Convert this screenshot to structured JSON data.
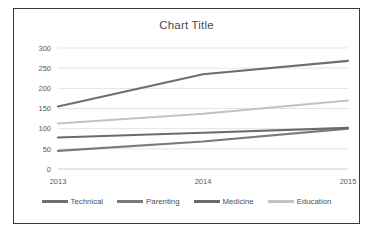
{
  "chart_data": {
    "type": "line",
    "title": "Chart Title",
    "xlabel": "",
    "ylabel": "",
    "categories": [
      "2013",
      "2014",
      "2015"
    ],
    "x": [
      2013,
      2014,
      2015
    ],
    "ylim": [
      0,
      300
    ],
    "yticks": [
      0,
      50,
      100,
      150,
      200,
      250,
      300
    ],
    "ytick_labels": [
      "0",
      "50",
      "100",
      "150",
      "200",
      "250",
      "300"
    ],
    "grid": "horizontal",
    "legend_position": "bottom",
    "series": [
      {
        "name": "Technical",
        "values": [
          155,
          235,
          268
        ],
        "color": "#6e6e6e"
      },
      {
        "name": "Parenting",
        "values": [
          45,
          68,
          100
        ],
        "color": "#7a7a7a"
      },
      {
        "name": "Medicine",
        "values": [
          78,
          90,
          102
        ],
        "color": "#6b6b6b"
      },
      {
        "name": "Education",
        "values": [
          113,
          137,
          170
        ],
        "color": "#c2c2c2"
      }
    ]
  },
  "legend": {
    "items": [
      {
        "label": "Technical"
      },
      {
        "label": "Parenting"
      },
      {
        "label": "Medicine"
      },
      {
        "label": "Education"
      }
    ]
  }
}
